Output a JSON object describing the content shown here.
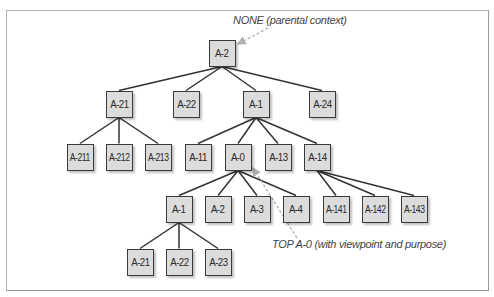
{
  "diagram": {
    "type": "tree",
    "annotations": [
      {
        "id": "parental",
        "text": "NONE (parental context)",
        "x": 233,
        "y": 14,
        "points_to": "n-A-2"
      },
      {
        "id": "top",
        "text": "TOP A-0 (with viewpoint and purpose)",
        "x": 272,
        "y": 238,
        "points_to": "n-A-0"
      }
    ],
    "nodes": [
      {
        "id": "n-A-2",
        "label": "A-2",
        "cx": 222,
        "cy": 53
      },
      {
        "id": "n-A-21",
        "label": "A-21",
        "cx": 119,
        "cy": 104
      },
      {
        "id": "n-A-22",
        "label": "A-22",
        "cx": 186,
        "cy": 104
      },
      {
        "id": "n-A-1",
        "label": "A-1",
        "cx": 256,
        "cy": 104
      },
      {
        "id": "n-A-24",
        "label": "A-24",
        "cx": 322,
        "cy": 104
      },
      {
        "id": "n-A-211",
        "label": "A-211",
        "cx": 80,
        "cy": 157
      },
      {
        "id": "n-A-212",
        "label": "A-212",
        "cx": 119,
        "cy": 157
      },
      {
        "id": "n-A-213",
        "label": "A-213",
        "cx": 158,
        "cy": 157
      },
      {
        "id": "n-A-11",
        "label": "A-11",
        "cx": 198,
        "cy": 157
      },
      {
        "id": "n-A-0",
        "label": "A-0",
        "cx": 238,
        "cy": 157
      },
      {
        "id": "n-A-13",
        "label": "A-13",
        "cx": 278,
        "cy": 157
      },
      {
        "id": "n-A-14",
        "label": "A-14",
        "cx": 317,
        "cy": 157
      },
      {
        "id": "n-A-0-1",
        "label": "A-1",
        "cx": 179,
        "cy": 209
      },
      {
        "id": "n-A-0-2",
        "label": "A-2",
        "cx": 218,
        "cy": 209
      },
      {
        "id": "n-A-0-3",
        "label": "A-3",
        "cx": 257,
        "cy": 209
      },
      {
        "id": "n-A-0-4",
        "label": "A-4",
        "cx": 296,
        "cy": 209
      },
      {
        "id": "n-A-141",
        "label": "A-141",
        "cx": 336,
        "cy": 209
      },
      {
        "id": "n-A-142",
        "label": "A-142",
        "cx": 375,
        "cy": 209
      },
      {
        "id": "n-A-143",
        "label": "A-143",
        "cx": 414,
        "cy": 209
      },
      {
        "id": "n-A-0-21",
        "label": "A-21",
        "cx": 140,
        "cy": 262
      },
      {
        "id": "n-A-0-22",
        "label": "A-22",
        "cx": 179,
        "cy": 262
      },
      {
        "id": "n-A-0-23",
        "label": "A-23",
        "cx": 218,
        "cy": 262
      }
    ],
    "edges": [
      [
        "n-A-2",
        "n-A-21"
      ],
      [
        "n-A-2",
        "n-A-22"
      ],
      [
        "n-A-2",
        "n-A-1"
      ],
      [
        "n-A-2",
        "n-A-24"
      ],
      [
        "n-A-21",
        "n-A-211"
      ],
      [
        "n-A-21",
        "n-A-212"
      ],
      [
        "n-A-21",
        "n-A-213"
      ],
      [
        "n-A-1",
        "n-A-11"
      ],
      [
        "n-A-1",
        "n-A-0"
      ],
      [
        "n-A-1",
        "n-A-13"
      ],
      [
        "n-A-1",
        "n-A-14"
      ],
      [
        "n-A-0",
        "n-A-0-1"
      ],
      [
        "n-A-0",
        "n-A-0-2"
      ],
      [
        "n-A-0",
        "n-A-0-3"
      ],
      [
        "n-A-0",
        "n-A-0-4"
      ],
      [
        "n-A-14",
        "n-A-141"
      ],
      [
        "n-A-14",
        "n-A-142"
      ],
      [
        "n-A-14",
        "n-A-143"
      ],
      [
        "n-A-0-1",
        "n-A-0-21"
      ],
      [
        "n-A-0-1",
        "n-A-0-22"
      ],
      [
        "n-A-0-1",
        "n-A-0-23"
      ]
    ],
    "pointers": [
      {
        "from": [
          268,
          28
        ],
        "to": [
          238,
          44
        ]
      },
      {
        "from": [
          297,
          238
        ],
        "to": [
          253,
          168
        ]
      }
    ],
    "colors": {
      "box_fill": "#dcdcdc",
      "box_border": "#3a3a3a",
      "edge": "#333333",
      "pointer": "#b0b0b0",
      "frame": "#b3b3b3"
    }
  }
}
